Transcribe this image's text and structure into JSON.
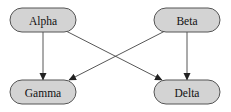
{
  "diagram": {
    "type": "directed-graph",
    "nodes": [
      {
        "id": "alpha",
        "label": "Alpha"
      },
      {
        "id": "beta",
        "label": "Beta"
      },
      {
        "id": "gamma",
        "label": "Gamma"
      },
      {
        "id": "delta",
        "label": "Delta"
      }
    ],
    "edges": [
      {
        "from": "alpha",
        "to": "gamma"
      },
      {
        "from": "alpha",
        "to": "delta"
      },
      {
        "from": "beta",
        "to": "gamma"
      },
      {
        "from": "beta",
        "to": "delta"
      }
    ],
    "colors": {
      "node_fill": "#d3d3d3",
      "node_stroke": "#555555",
      "edge": "#444444",
      "text": "#111111"
    }
  }
}
